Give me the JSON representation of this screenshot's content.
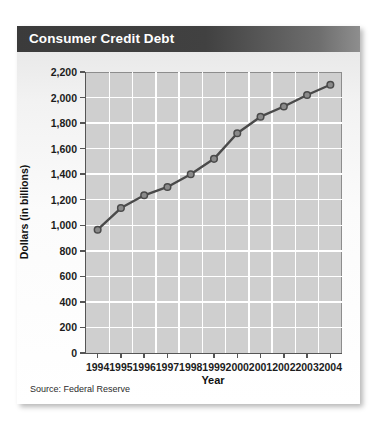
{
  "panel": {
    "title": "Consumer Credit Debt",
    "source": "Source: Federal Reserve"
  },
  "colors": {
    "title_bar_dark": "#3b3b3b",
    "title_bar_light": "#8e8e8e",
    "plot_background": "#cfcfcf",
    "gridline": "#ffffff",
    "axis": "#555555",
    "series_line": "#4a4a4a",
    "marker_fill": "#8a8a8a",
    "title_text": "#ffffff"
  },
  "chart_data": {
    "type": "line",
    "title": "Consumer Credit Debt",
    "xlabel": "Year",
    "ylabel": "Dollars (in billions)",
    "categories": [
      "1994",
      "1995",
      "1996",
      "1997",
      "1998",
      "1999",
      "2000",
      "2001",
      "2002",
      "2003",
      "2004"
    ],
    "values": [
      965,
      1135,
      1235,
      1300,
      1400,
      1520,
      1720,
      1850,
      1930,
      2020,
      2100
    ],
    "ylim": [
      0,
      2200
    ],
    "ytick_step": 200,
    "ytick_labels": [
      "0",
      "200",
      "400",
      "600",
      "800",
      "1,000",
      "1,200",
      "1,400",
      "1,600",
      "1,800",
      "2,000",
      "2,200"
    ],
    "ytick_values": [
      0,
      200,
      400,
      600,
      800,
      1000,
      1200,
      1400,
      1600,
      1800,
      2000,
      2200
    ],
    "grid": true,
    "legend": "none",
    "source_note": "Source: Federal Reserve"
  }
}
